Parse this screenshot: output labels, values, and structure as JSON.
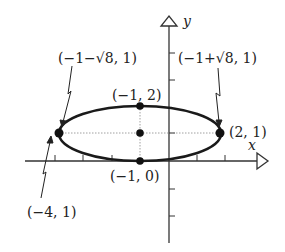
{
  "figure": {
    "axes": {
      "x_label": "x",
      "y_label": "y",
      "x_ticks": [
        -4,
        -3,
        -2,
        -1,
        1,
        2
      ],
      "y_ticks": [
        -3,
        -2,
        1,
        2,
        3
      ]
    },
    "points": {
      "top": "(−1, 2)",
      "bottom": "(−1, 0)",
      "right_vertex": "(2, 1)",
      "left_vertex": "(−4, 1)",
      "left_focus": "(−1−√8, 1)",
      "right_focus": "(−1+√8, 1)"
    },
    "colors": {
      "stroke": "#1a1a1a",
      "axis": "#333333",
      "guide": "#888888"
    }
  }
}
